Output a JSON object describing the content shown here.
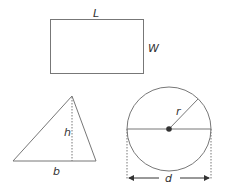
{
  "rectangle": {
    "length_label": "L",
    "width_label": "W"
  },
  "triangle": {
    "height_label": "h",
    "base_label": "b"
  },
  "circle": {
    "radius_label": "r",
    "diameter_label": "d"
  },
  "colors": {
    "stroke": "#777777",
    "text": "#333333",
    "center_dot": "#333333"
  }
}
